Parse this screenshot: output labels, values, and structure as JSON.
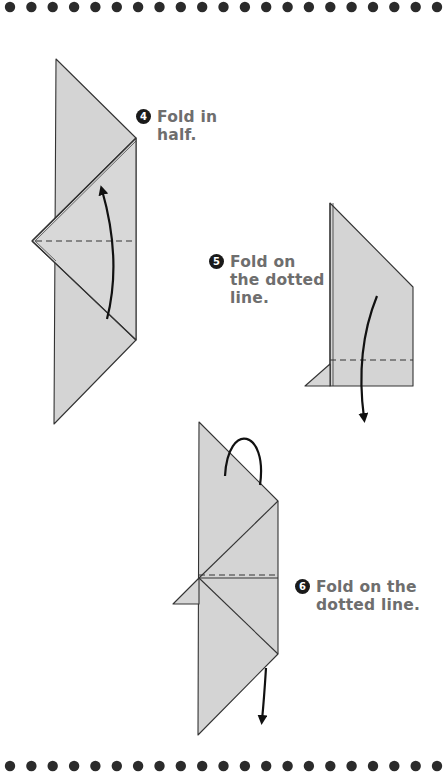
{
  "decorations": {
    "dot_rows": [
      {
        "position": "top",
        "count": 21,
        "color": "#2b2b2b"
      },
      {
        "position": "bottom",
        "count": 21,
        "color": "#2b2b2b"
      }
    ]
  },
  "colors": {
    "paper_fill": "#d3d3d3",
    "line": "#333333",
    "text": "#6e6e6e",
    "badge": "#1a1a1a"
  },
  "steps": [
    {
      "number": "4",
      "text": "Fold in\nhalf."
    },
    {
      "number": "5",
      "text": "Fold on\nthe dotted\nline."
    },
    {
      "number": "6",
      "text": "Fold on the\ndotted line."
    }
  ]
}
